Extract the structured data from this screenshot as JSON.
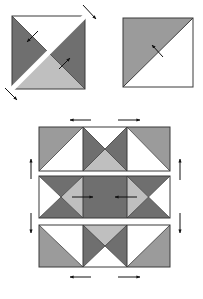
{
  "figure": {
    "colors": {
      "dark": "#6f6f6f",
      "medium": "#9b9b9b",
      "light": "#bfbfbf",
      "white": "#ffffff",
      "outline": "#3a3a3a",
      "arrow": "#111111"
    },
    "top_left_unit": {
      "name": "hourglass-unit-cut-diagonally",
      "quarters": {
        "top": "white",
        "left": "dark",
        "right": "dark",
        "bottom": "light"
      }
    },
    "top_right_unit": {
      "name": "half-square-triangle-unit",
      "halves": {
        "upper_left": "medium",
        "lower_right": "white"
      }
    },
    "block": {
      "rows": [
        {
          "units": [
            "hst-medium-top-left",
            "hourglass-dark-sides-light-bottom",
            "hst-medium-top-right"
          ],
          "press_arrows": [
            "left",
            "right"
          ]
        },
        {
          "units": [
            "quarter-square-dark-light-right",
            "solid-dark",
            "quarter-square-dark-light-left"
          ],
          "press_arrows": [
            "right",
            "left"
          ]
        },
        {
          "units": [
            "hst-medium-bottom-left",
            "hourglass-dark-sides-light-top",
            "hst-medium-bottom-right"
          ],
          "press_arrows": [
            "left",
            "right"
          ]
        }
      ],
      "seam_arrows": [
        "up",
        "down"
      ]
    }
  }
}
